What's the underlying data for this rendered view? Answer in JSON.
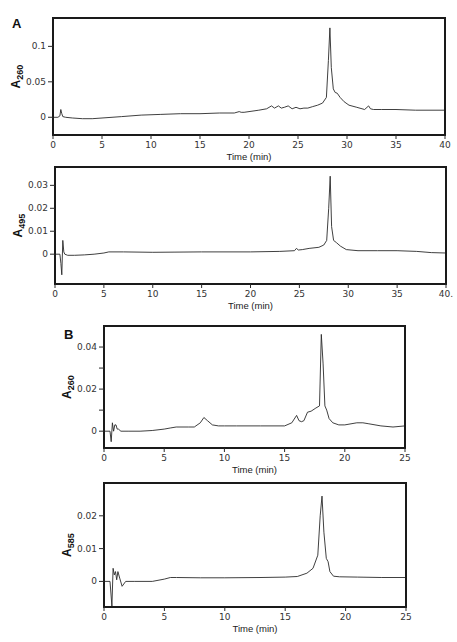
{
  "figure": {
    "panel_labels": [
      {
        "text": "A",
        "x": 12,
        "y": 28
      },
      {
        "text": "B",
        "x": 64,
        "y": 339
      }
    ]
  },
  "chart_data": [
    {
      "id": "A-260",
      "type": "line",
      "title": "",
      "xlabel": "Time (min)",
      "ylabel": "A",
      "ylabel_sub": "260",
      "xlim": [
        0,
        40
      ],
      "ylim": [
        -0.025,
        0.14
      ],
      "xticks": [
        0,
        5,
        10,
        15,
        20,
        25,
        30,
        35,
        40
      ],
      "xtick_labels": [
        "0",
        "5",
        "10",
        "15",
        "20",
        "25",
        "30",
        "35",
        "40"
      ],
      "yticks": [
        0,
        0.05,
        0.1
      ],
      "ytick_labels": [
        "0",
        "0.05",
        "0.1"
      ],
      "grid": false,
      "frame_px": {
        "left": 53,
        "top": 18,
        "right": 445,
        "bottom": 135
      },
      "x": [
        0,
        0.5,
        0.7,
        0.8,
        0.9,
        1.0,
        1.3,
        2,
        3,
        4,
        5,
        7,
        9,
        11,
        13,
        15,
        17,
        18.5,
        19.0,
        19.2,
        19.5,
        20,
        21,
        21.8,
        22.3,
        22.6,
        23.0,
        23.3,
        23.6,
        24.0,
        24.4,
        24.8,
        25.2,
        25.6,
        26,
        26.5,
        27,
        27.5,
        27.9,
        28.1,
        28.25,
        28.4,
        28.6,
        28.8,
        29.0,
        29.3,
        29.7,
        30.2,
        31,
        31.8,
        32.2,
        32.4,
        32.7,
        33.5,
        35,
        37,
        40
      ],
      "series": [
        {
          "name": "A260",
          "values": [
            0,
            0,
            0.002,
            0.011,
            0.005,
            0.001,
            0,
            -0.001,
            -0.002,
            -0.002,
            -0.001,
            0.001,
            0.003,
            0.004,
            0.005,
            0.005,
            0.006,
            0.006,
            0.008,
            0.007,
            0.007,
            0.008,
            0.01,
            0.012,
            0.016,
            0.013,
            0.016,
            0.013,
            0.014,
            0.016,
            0.012,
            0.014,
            0.012,
            0.013,
            0.013,
            0.015,
            0.017,
            0.02,
            0.028,
            0.08,
            0.126,
            0.07,
            0.04,
            0.035,
            0.034,
            0.028,
            0.022,
            0.017,
            0.014,
            0.011,
            0.016,
            0.012,
            0.011,
            0.011,
            0.011,
            0.01,
            0.01
          ]
        }
      ]
    },
    {
      "id": "A-495",
      "type": "line",
      "title": "",
      "xlabel": "Time (min)",
      "ylabel": "A",
      "ylabel_sub": "495",
      "xlim": [
        0,
        40
      ],
      "ylim": [
        -0.013,
        0.038
      ],
      "xticks": [
        0,
        5,
        10,
        15,
        20,
        25,
        30,
        35,
        40
      ],
      "xtick_labels": [
        "0",
        "5",
        "10",
        "15",
        "20",
        "25",
        "30",
        "35",
        "40."
      ],
      "yticks": [
        0,
        0.01,
        0.02,
        0.03
      ],
      "ytick_labels": [
        "0",
        "0.01",
        "0.02",
        "0.03"
      ],
      "grid": false,
      "frame_px": {
        "left": 55,
        "top": 167,
        "right": 446,
        "bottom": 284
      },
      "x": [
        0,
        0.5,
        0.6,
        0.7,
        0.8,
        0.9,
        1.0,
        1.3,
        2,
        3,
        4,
        5,
        5.5,
        7,
        10,
        15,
        20,
        23,
        24.5,
        24.7,
        24.9,
        25.3,
        26,
        27,
        27.5,
        27.8,
        28.0,
        28.15,
        28.3,
        28.5,
        28.8,
        29.2,
        29.8,
        31,
        33,
        35,
        37,
        38.5,
        40
      ],
      "series": [
        {
          "name": "A495",
          "values": [
            0,
            0,
            -0.004,
            -0.009,
            0.006,
            0.001,
            0,
            -0.0005,
            -0.0005,
            -0.0003,
            0,
            0.0005,
            0.001,
            0.001,
            0.0008,
            0.001,
            0.001,
            0.0012,
            0.0015,
            0.0025,
            0.0018,
            0.002,
            0.0025,
            0.003,
            0.004,
            0.006,
            0.02,
            0.034,
            0.012,
            0.006,
            0.005,
            0.0035,
            0.002,
            0.0015,
            0.0015,
            0.0015,
            0.0012,
            0.0007,
            0.0005
          ]
        }
      ]
    },
    {
      "id": "B-260",
      "type": "line",
      "title": "",
      "xlabel": "Time (min)",
      "ylabel": "A",
      "ylabel_sub": "260",
      "xlim": [
        0,
        25
      ],
      "ylim": [
        -0.008,
        0.05
      ],
      "xticks": [
        0,
        5,
        10,
        15,
        20,
        25
      ],
      "xtick_labels": [
        "0",
        "5",
        "10",
        "15",
        "20",
        "25"
      ],
      "yticks": [
        0,
        0.01,
        0.02,
        0.03,
        0.04
      ],
      "ytick_labels": [
        "0",
        "",
        "0.02",
        "",
        "0.04"
      ],
      "grid": false,
      "frame_px": {
        "left": 104,
        "top": 326,
        "right": 405,
        "bottom": 448
      },
      "x": [
        0,
        0.5,
        0.6,
        0.7,
        0.8,
        0.9,
        1.0,
        1.1,
        1.2,
        1.4,
        2,
        3,
        4,
        5,
        5.5,
        6,
        7,
        7.5,
        8.0,
        8.3,
        8.6,
        9.0,
        9.5,
        10,
        11,
        13,
        15,
        15.6,
        16.0,
        16.2,
        16.4,
        16.6,
        16.9,
        17.2,
        17.6,
        17.9,
        18.05,
        18.2,
        18.35,
        18.5,
        18.7,
        19,
        19.5,
        20,
        21,
        21.5,
        22,
        23,
        24,
        25
      ],
      "series": [
        {
          "name": "A260",
          "values": [
            0,
            0,
            -0.005,
            0.004,
            0,
            0.003,
            0.003,
            0.001,
            0.001,
            0,
            0,
            0,
            0.0003,
            0.001,
            0.0015,
            0.002,
            0.002,
            0.002,
            0.004,
            0.0065,
            0.005,
            0.003,
            0.0025,
            0.0025,
            0.0025,
            0.0025,
            0.0025,
            0.004,
            0.0075,
            0.005,
            0.0045,
            0.005,
            0.009,
            0.0095,
            0.011,
            0.012,
            0.046,
            0.032,
            0.012,
            0.01,
            0.006,
            0.004,
            0.003,
            0.003,
            0.004,
            0.004,
            0.0035,
            0.0025,
            0.002,
            0.0025
          ]
        }
      ]
    },
    {
      "id": "B-585",
      "type": "line",
      "title": "",
      "xlabel": "Time (min)",
      "ylabel": "A",
      "ylabel_sub": "585",
      "xlim": [
        0,
        25
      ],
      "ylim": [
        -0.0078,
        0.03
      ],
      "xticks": [
        0,
        5,
        10,
        15,
        20,
        25
      ],
      "xtick_labels": [
        "0",
        "5",
        "10",
        "15",
        "20",
        "25"
      ],
      "yticks": [
        0,
        0.01,
        0.02
      ],
      "ytick_labels": [
        "0",
        "0.01",
        "0.02"
      ],
      "grid": false,
      "frame_px": {
        "left": 104,
        "top": 483,
        "right": 406,
        "bottom": 607
      },
      "x": [
        0,
        0.5,
        0.65,
        0.75,
        0.85,
        0.95,
        1.05,
        1.15,
        1.3,
        1.5,
        1.8,
        2.5,
        4,
        5,
        5.5,
        6,
        8,
        10,
        13,
        15,
        16,
        16.8,
        17.3,
        17.7,
        17.9,
        18.05,
        18.2,
        18.4,
        18.55,
        18.7,
        19,
        19.5,
        21,
        23,
        25
      ],
      "series": [
        {
          "name": "A585",
          "values": [
            0,
            0,
            -0.0075,
            0.004,
            0.002,
            0.003,
            0.0005,
            0.003,
            0.001,
            -0.0015,
            0,
            0,
            0,
            0.0007,
            0.0012,
            0.0012,
            0.0011,
            0.0011,
            0.0012,
            0.0013,
            0.0015,
            0.0025,
            0.004,
            0.008,
            0.02,
            0.026,
            0.015,
            0.007,
            0.006,
            0.003,
            0.0016,
            0.0014,
            0.0013,
            0.0012,
            0.0012
          ]
        }
      ]
    }
  ]
}
